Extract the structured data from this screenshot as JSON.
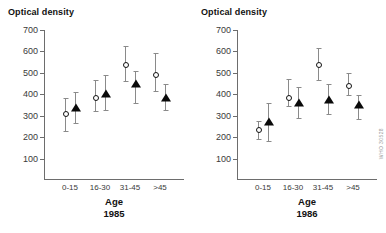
{
  "figure": {
    "credit": "WHO 30528",
    "panels": [
      {
        "id": "panel-1985",
        "ylabel": "Optical density",
        "xlabel": "Age",
        "year": "1985"
      },
      {
        "id": "panel-1986",
        "ylabel": "Optical density",
        "xlabel": "Age",
        "year": "1986"
      }
    ]
  },
  "chart_data": [
    {
      "type": "scatter",
      "title": "1985",
      "xlabel": "Age",
      "ylabel": "Optical density",
      "ylim": [
        0,
        700
      ],
      "yticks": [
        100,
        200,
        300,
        400,
        500,
        600,
        700
      ],
      "ytick_labels": [
        "100",
        "200",
        "300",
        "400",
        "500",
        "600",
        "700"
      ],
      "categories": [
        "0-15",
        "16-30",
        "31-45",
        ">45"
      ],
      "grid": false,
      "legend": "none",
      "series": [
        {
          "name": "open-circle",
          "marker": "open circle",
          "values": [
            310,
            385,
            535,
            490
          ],
          "err_low": [
            230,
            320,
            460,
            415
          ],
          "err_high": [
            385,
            465,
            625,
            595
          ]
        },
        {
          "name": "filled-triangle",
          "marker": "filled triangle",
          "values": [
            335,
            400,
            450,
            385
          ],
          "err_low": [
            265,
            325,
            360,
            325
          ],
          "err_high": [
            410,
            490,
            510,
            450
          ]
        }
      ]
    },
    {
      "type": "scatter",
      "title": "1986",
      "xlabel": "Age",
      "ylabel": "Optical density",
      "ylim": [
        0,
        700
      ],
      "yticks": [
        100,
        200,
        300,
        400,
        500,
        600,
        700
      ],
      "ytick_labels": [
        "100",
        "200",
        "300",
        "400",
        "500",
        "600",
        "700"
      ],
      "categories": [
        "0-15",
        "16-30",
        "31-45",
        ">45"
      ],
      "grid": false,
      "legend": "none",
      "series": [
        {
          "name": "open-circle",
          "marker": "open circle",
          "values": [
            232,
            383,
            538,
            437
          ],
          "err_low": [
            190,
            345,
            465,
            395
          ],
          "err_high": [
            275,
            470,
            618,
            500
          ]
        },
        {
          "name": "filled-triangle",
          "marker": "filled triangle",
          "values": [
            270,
            358,
            372,
            350
          ],
          "err_low": [
            180,
            288,
            310,
            285
          ],
          "err_high": [
            360,
            432,
            450,
            395
          ]
        }
      ]
    }
  ]
}
